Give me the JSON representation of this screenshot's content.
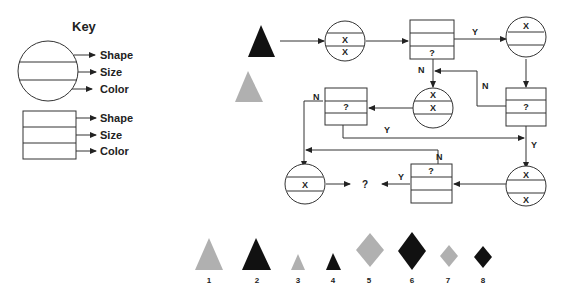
{
  "key": {
    "title": "Key",
    "circle_labels": [
      "Shape",
      "Size",
      "Color"
    ],
    "box_labels": [
      "Shape",
      "Size",
      "Color"
    ]
  },
  "start": {
    "primary_triangle_color": "#111111",
    "secondary_triangle_color": "#b0b0b0"
  },
  "nodes": {
    "c1": {
      "rows": [
        "",
        "X",
        "X"
      ]
    },
    "b1": {
      "rows": [
        "",
        "",
        "?"
      ]
    },
    "c2": {
      "rows": [
        "X",
        "",
        ""
      ]
    },
    "b2": {
      "rows": [
        "",
        "?",
        ""
      ]
    },
    "c3": {
      "rows": [
        "X",
        "X",
        ""
      ]
    },
    "b3": {
      "rows": [
        "",
        "?",
        ""
      ]
    },
    "c4": {
      "rows": [
        "X",
        "",
        "X"
      ]
    },
    "b4": {
      "rows": [
        "?",
        "",
        ""
      ]
    },
    "c5": {
      "rows": [
        "",
        "X",
        ""
      ]
    }
  },
  "edge_labels": {
    "b1_yes": "Y",
    "b1_no": "N",
    "b2_no": "N",
    "b3_no": "N",
    "b3_yes": "Y",
    "b2_yes": "Y",
    "b4_no": "N",
    "b4_yes": "Y"
  },
  "end_label": "?",
  "options": [
    {
      "num": "1",
      "shape": "triangle",
      "size": "large",
      "color": "gray"
    },
    {
      "num": "2",
      "shape": "triangle",
      "size": "large",
      "color": "black"
    },
    {
      "num": "3",
      "shape": "triangle",
      "size": "small",
      "color": "gray"
    },
    {
      "num": "4",
      "shape": "triangle",
      "size": "small",
      "color": "black"
    },
    {
      "num": "5",
      "shape": "diamond",
      "size": "large",
      "color": "gray"
    },
    {
      "num": "6",
      "shape": "diamond",
      "size": "large",
      "color": "black"
    },
    {
      "num": "7",
      "shape": "diamond",
      "size": "small",
      "color": "gray"
    },
    {
      "num": "8",
      "shape": "diamond",
      "size": "small",
      "color": "black"
    }
  ],
  "colors": {
    "gray": "#b0b0b0",
    "black": "#111111",
    "line": "#333333"
  }
}
